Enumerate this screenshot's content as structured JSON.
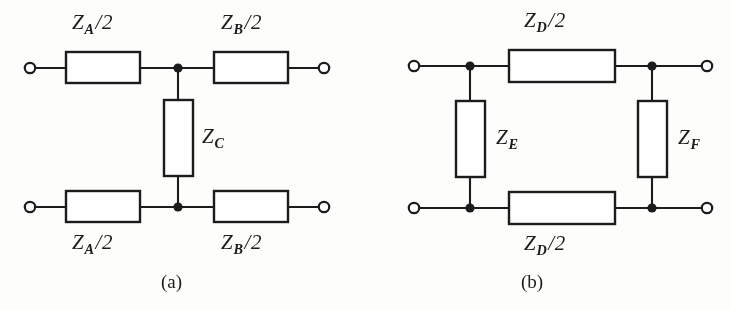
{
  "figure": {
    "background_color": "#fdfdfc",
    "ink_color": "#1c1c1c",
    "panels": [
      {
        "id": "a",
        "caption": "(a)",
        "type": "T-network",
        "elements": [
          {
            "name": "z-a-half-top",
            "symbol": "Z",
            "subscript": "A",
            "divisor": "2",
            "orientation": "horizontal",
            "position": "top-left"
          },
          {
            "name": "z-b-half-top",
            "symbol": "Z",
            "subscript": "B",
            "divisor": "2",
            "orientation": "horizontal",
            "position": "top-right"
          },
          {
            "name": "z-c-shunt",
            "symbol": "Z",
            "subscript": "C",
            "divisor": "",
            "orientation": "vertical",
            "position": "center-shunt"
          },
          {
            "name": "z-a-half-bottom",
            "symbol": "Z",
            "subscript": "A",
            "divisor": "2",
            "orientation": "horizontal",
            "position": "bottom-left"
          },
          {
            "name": "z-b-half-bottom",
            "symbol": "Z",
            "subscript": "B",
            "divisor": "2",
            "orientation": "horizontal",
            "position": "bottom-right"
          }
        ],
        "terminals": 4,
        "junction_nodes": 2
      },
      {
        "id": "b",
        "caption": "(b)",
        "type": "ladder-network",
        "elements": [
          {
            "name": "z-d-half-top",
            "symbol": "Z",
            "subscript": "D",
            "divisor": "2",
            "orientation": "horizontal",
            "position": "top"
          },
          {
            "name": "z-e-shunt",
            "symbol": "Z",
            "subscript": "E",
            "divisor": "",
            "orientation": "vertical",
            "position": "left-shunt"
          },
          {
            "name": "z-f-shunt",
            "symbol": "Z",
            "subscript": "F",
            "divisor": "",
            "orientation": "vertical",
            "position": "right-shunt"
          },
          {
            "name": "z-d-half-bottom",
            "symbol": "Z",
            "subscript": "D",
            "divisor": "2",
            "orientation": "horizontal",
            "position": "bottom"
          }
        ],
        "terminals": 4,
        "junction_nodes": 4
      }
    ]
  },
  "labels": {
    "a_top_left": {
      "symbol": "Z",
      "sub": "A",
      "slash": "/",
      "den": "2"
    },
    "a_top_right": {
      "symbol": "Z",
      "sub": "B",
      "slash": "/",
      "den": "2"
    },
    "a_shunt": {
      "symbol": "Z",
      "sub": "C",
      "slash": "",
      "den": ""
    },
    "a_bottom_left": {
      "symbol": "Z",
      "sub": "A",
      "slash": "/",
      "den": "2"
    },
    "a_bottom_right": {
      "symbol": "Z",
      "sub": "B",
      "slash": "/",
      "den": "2"
    },
    "b_top": {
      "symbol": "Z",
      "sub": "D",
      "slash": "/",
      "den": "2"
    },
    "b_left_shunt": {
      "symbol": "Z",
      "sub": "E",
      "slash": "",
      "den": ""
    },
    "b_right_shunt": {
      "symbol": "Z",
      "sub": "F",
      "slash": "",
      "den": ""
    },
    "b_bottom": {
      "symbol": "Z",
      "sub": "D",
      "slash": "/",
      "den": "2"
    }
  },
  "captions": {
    "panel_a": "(a)",
    "panel_b": "(b)"
  }
}
